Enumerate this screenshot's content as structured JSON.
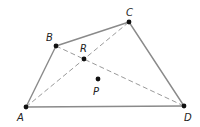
{
  "diagram": {
    "type": "quadrilateral-with-diagonals",
    "colors": {
      "edge": "#8a8a8a",
      "diagonal": "#9a9a9a",
      "point": "#111111",
      "label": "#222222"
    },
    "points": {
      "A": {
        "label": "A",
        "x": 26,
        "y": 107,
        "lx": 17,
        "ly": 121
      },
      "B": {
        "label": "B",
        "x": 56,
        "y": 46,
        "lx": 46,
        "ly": 41
      },
      "C": {
        "label": "C",
        "x": 129,
        "y": 22,
        "lx": 126,
        "ly": 16
      },
      "D": {
        "label": "D",
        "x": 184,
        "y": 106,
        "lx": 184,
        "ly": 121
      },
      "R": {
        "label": "R",
        "x": 84,
        "y": 59,
        "lx": 80,
        "ly": 52
      },
      "P": {
        "label": "P",
        "x": 98,
        "y": 79,
        "lx": 93,
        "ly": 95
      }
    },
    "edges": [
      [
        "A",
        "B"
      ],
      [
        "B",
        "C"
      ],
      [
        "C",
        "D"
      ],
      [
        "D",
        "A"
      ]
    ],
    "diagonals": [
      [
        "A",
        "C"
      ],
      [
        "B",
        "D"
      ]
    ]
  }
}
